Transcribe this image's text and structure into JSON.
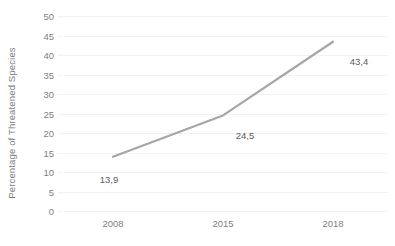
{
  "chart_data": {
    "type": "line",
    "title": "",
    "xlabel": "",
    "ylabel": "Percentage of Threatened Species",
    "categories": [
      "2008",
      "2015",
      "2018"
    ],
    "x": [
      2008,
      2015,
      2018
    ],
    "values": [
      13.9,
      24.5,
      43.4
    ],
    "data_labels": [
      "13,9",
      "24,5",
      "43,4"
    ],
    "series": [
      {
        "name": "Percentage of Threatened Species",
        "values": [
          13.9,
          24.5,
          43.4
        ],
        "color": "#a6a6a6"
      }
    ],
    "ylim": [
      0,
      50
    ],
    "ytick_step": 5,
    "yticks": [
      50,
      45,
      40,
      35,
      30,
      25,
      20,
      15,
      10,
      5,
      0
    ],
    "ytick_labels": [
      "50",
      "45",
      "40",
      "35",
      "30",
      "25",
      "20",
      "15",
      "10",
      "5",
      "0"
    ],
    "xtick_labels": [
      "2008",
      "2015",
      "2018"
    ],
    "grid": true,
    "grid_axis": "y",
    "legend": false,
    "legend_position": "none",
    "decimal_separator": ",",
    "colors": {
      "line": "#a6a6a6",
      "gridline": "#f2f2f2",
      "tick_label": "#808080",
      "axis_title": "#7b7b7b",
      "data_label": "#5a5a5a",
      "background": "#ffffff"
    }
  }
}
